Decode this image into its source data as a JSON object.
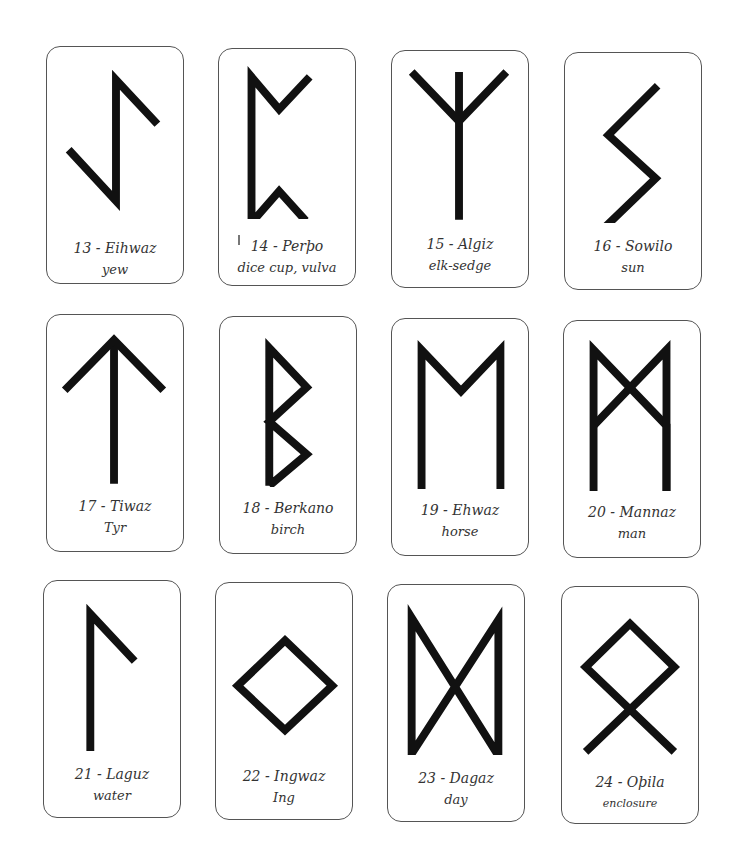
{
  "cards": [
    {
      "id": 13,
      "name": "13 - Eihwaz",
      "meaning": "yew",
      "rune": "eihwaz-rune"
    },
    {
      "id": 14,
      "name": "14 - Perþo",
      "meaning": "dice cup, vulva",
      "rune": "perthro-rune"
    },
    {
      "id": 15,
      "name": "15 - Algiz",
      "meaning": "elk-sedge",
      "rune": "algiz-rune"
    },
    {
      "id": 16,
      "name": "16 - Sowilo",
      "meaning": "sun",
      "rune": "sowilo-rune"
    },
    {
      "id": 17,
      "name": "17 - Tiwaz",
      "meaning": "Tyr",
      "rune": "tiwaz-rune"
    },
    {
      "id": 18,
      "name": "18 - Berkano",
      "meaning": "birch",
      "rune": "berkano-rune"
    },
    {
      "id": 19,
      "name": "19 - Ehwaz",
      "meaning": "horse",
      "rune": "ehwaz-rune"
    },
    {
      "id": 20,
      "name": "20 - Mannaz",
      "meaning": "man",
      "rune": "mannaz-rune"
    },
    {
      "id": 21,
      "name": "21 - Laguz",
      "meaning": "water",
      "rune": "laguz-rune"
    },
    {
      "id": 22,
      "name": "22 - Ingwaz",
      "meaning": "Ing",
      "rune": "ingwaz-rune"
    },
    {
      "id": 23,
      "name": "23 - Dagaz",
      "meaning": "day",
      "rune": "dagaz-rune"
    },
    {
      "id": 24,
      "name": "24 - Oþila",
      "meaning": "enclosure",
      "rune": "othala-rune"
    }
  ],
  "colors": {
    "rune_stroke": "#111111",
    "card_border": "#555555",
    "text": "#333333"
  }
}
